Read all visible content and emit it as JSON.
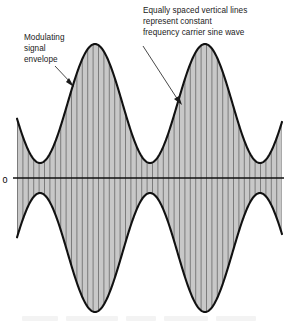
{
  "figure": {
    "background_color": "#ffffff",
    "fill_color": "#c8c8c8",
    "envelope_color": "#111111",
    "carrier_line_color": "#6e6e6e",
    "axis_color": "#111111",
    "text_color": "#1a1a1a"
  },
  "annotations": {
    "left": {
      "name": "modulating-signal-envelope",
      "lines": [
        "Modulating",
        "signal",
        "envelope"
      ],
      "x": 24,
      "y": 40,
      "line_height": 11,
      "leader": {
        "x1": 55,
        "y1": 66,
        "x2": 74,
        "y2": 86
      }
    },
    "right": {
      "name": "carrier-vertical-lines",
      "lines": [
        "Equally spaced vertical lines",
        "represent constant",
        "frequency carrier sine wave"
      ],
      "x": 143,
      "y": 13,
      "line_height": 11,
      "leader": {
        "x1": 143,
        "y1": 46,
        "x2": 181,
        "y2": 104
      }
    }
  },
  "axis": {
    "zero_label": "0",
    "zero_label_x": 5,
    "zero_label_y": 181,
    "zero_y": 178,
    "x_start": 13,
    "x_end": 284
  },
  "chart_data": {
    "type": "line",
    "xlabel": "",
    "ylabel": "",
    "grid": false,
    "legend": null,
    "x_range": [
      17,
      282
    ],
    "y_range": [
      312,
      44
    ],
    "zero_y": 178,
    "envelope": {
      "description": "Modulating signal envelope - sinusoidal amplitude variation about the zero axis",
      "peak_amplitude_px": 134,
      "trough_amplitude_px": 15,
      "modulation_period_px": 110,
      "peak_x_positions": [
        95,
        204
      ],
      "trough_x_positions": [
        38,
        148,
        258
      ],
      "upper_peak_y": 44,
      "lower_peak_y": 312,
      "upper_trough_y": 163,
      "lower_trough_y": 193
    },
    "carrier": {
      "description": "Equally spaced vertical lines represent constant frequency carrier sine wave",
      "line_spacing_px": 5.4,
      "line_count": 50,
      "first_line_x": 17.5,
      "color": "#6e6e6e"
    }
  }
}
